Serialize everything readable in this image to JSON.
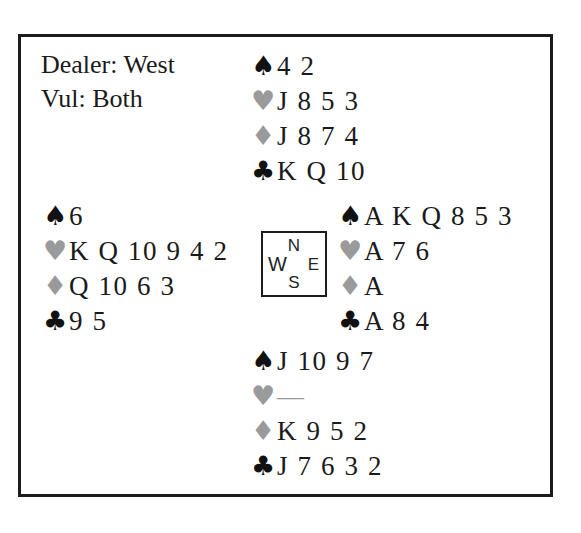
{
  "deal_info": {
    "dealer": "Dealer: West",
    "vulnerability": "Vul: Both"
  },
  "suit_symbols": {
    "spade": "♠",
    "heart": "♥",
    "diamond": "♦",
    "club": "♣"
  },
  "colors": {
    "black_suit": "#111111",
    "red_suit_gray": "#9a9a9a",
    "border": "#1c1c1c",
    "background": "#ffffff"
  },
  "compass": {
    "north": "N",
    "east": "E",
    "south": "S",
    "west": "W"
  },
  "hands": {
    "north": {
      "label": "North",
      "spades": "4 2",
      "hearts": "J 8 5 3",
      "diamonds": "J 8 7 4",
      "clubs": "K Q 10"
    },
    "west": {
      "label": "West",
      "spades": "6",
      "hearts": "K Q 10 9 4 2",
      "diamonds": "Q 10 6 3",
      "clubs": "9 5"
    },
    "east": {
      "label": "East",
      "spades": "A K Q 8 5 3",
      "hearts": "A 7 6",
      "diamonds": "A",
      "clubs": "A 8 4"
    },
    "south": {
      "label": "South",
      "spades": "J 10 9 7",
      "hearts": "—",
      "diamonds": "K 9 5 2",
      "clubs": "J 7 6 3 2"
    }
  }
}
